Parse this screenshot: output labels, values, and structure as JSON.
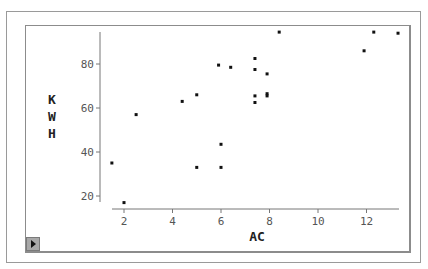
{
  "chart_data": {
    "type": "scatter",
    "title": "",
    "xlabel": "AC",
    "ylabel": "KWH",
    "xlim": [
      1.5,
      13.5
    ],
    "ylim": [
      17,
      96
    ],
    "x_ticks": [
      2,
      4,
      6,
      8,
      10,
      12
    ],
    "y_ticks": [
      20,
      40,
      60,
      80
    ],
    "grid": false,
    "legend": null,
    "points": [
      {
        "x": 1.5,
        "y": 35
      },
      {
        "x": 2.0,
        "y": 17
      },
      {
        "x": 2.5,
        "y": 57
      },
      {
        "x": 4.4,
        "y": 63
      },
      {
        "x": 5.0,
        "y": 66
      },
      {
        "x": 5.0,
        "y": 33
      },
      {
        "x": 5.9,
        "y": 79.5
      },
      {
        "x": 6.4,
        "y": 78.5
      },
      {
        "x": 6.0,
        "y": 43.5
      },
      {
        "x": 6.0,
        "y": 33
      },
      {
        "x": 7.4,
        "y": 82.5
      },
      {
        "x": 7.4,
        "y": 77.5
      },
      {
        "x": 7.4,
        "y": 65.5
      },
      {
        "x": 7.4,
        "y": 62.5
      },
      {
        "x": 7.9,
        "y": 75.5
      },
      {
        "x": 7.9,
        "y": 66.5
      },
      {
        "x": 7.9,
        "y": 65.5
      },
      {
        "x": 8.4,
        "y": 94.5
      },
      {
        "x": 11.9,
        "y": 86
      },
      {
        "x": 12.3,
        "y": 94.5
      },
      {
        "x": 13.3,
        "y": 94
      }
    ]
  },
  "axes": {
    "x_title": "AC",
    "y_title_letters": [
      "K",
      "W",
      "H"
    ],
    "x_tick_labels": [
      "2",
      "4",
      "6",
      "8",
      "10",
      "12"
    ],
    "y_tick_labels": [
      "20",
      "40",
      "60",
      "80"
    ]
  },
  "controls": {
    "play_icon": "play-triangle-icon"
  },
  "colors": {
    "point": "#111111",
    "axis": "#777777",
    "frame": "#8c8c8c",
    "button": "#a8a8a8"
  }
}
